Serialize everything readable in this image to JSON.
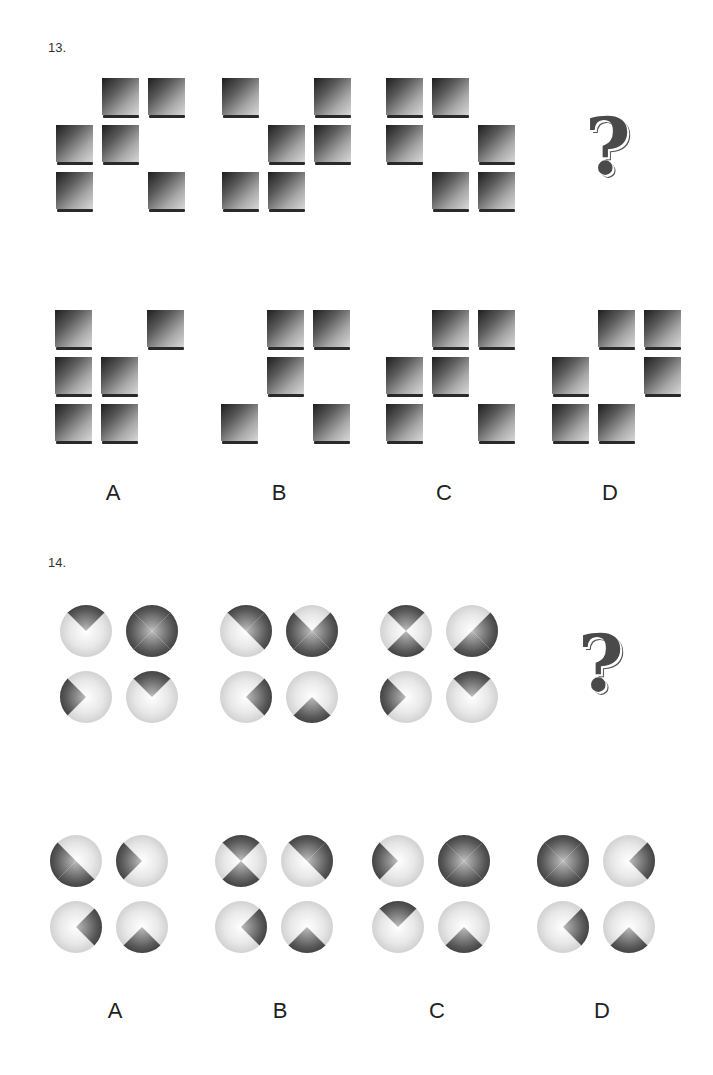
{
  "problems": [
    {
      "number": "13.",
      "type": "square-grid",
      "sequence": [
        {
          "grid": [
            [
              0,
              1,
              1
            ],
            [
              1,
              1,
              0
            ],
            [
              1,
              0,
              1
            ]
          ]
        },
        {
          "grid": [
            [
              1,
              0,
              1
            ],
            [
              0,
              1,
              1
            ],
            [
              1,
              1,
              0
            ]
          ]
        },
        {
          "grid": [
            [
              1,
              1,
              0
            ],
            [
              1,
              0,
              1
            ],
            [
              0,
              1,
              1
            ]
          ]
        }
      ],
      "question_mark": "?",
      "options": [
        {
          "label": "A",
          "grid": [
            [
              1,
              0,
              1
            ],
            [
              1,
              1,
              0
            ],
            [
              1,
              1,
              0
            ]
          ]
        },
        {
          "label": "B",
          "grid": [
            [
              0,
              1,
              1
            ],
            [
              0,
              1,
              0
            ],
            [
              1,
              0,
              1
            ]
          ]
        },
        {
          "label": "C",
          "grid": [
            [
              0,
              1,
              1
            ],
            [
              1,
              1,
              0
            ],
            [
              1,
              0,
              1
            ]
          ]
        },
        {
          "label": "D",
          "grid": [
            [
              0,
              1,
              1
            ],
            [
              1,
              0,
              1
            ],
            [
              1,
              1,
              0
            ]
          ]
        }
      ]
    },
    {
      "number": "14.",
      "type": "circle-wedges",
      "sequence": [
        {
          "circles": [
            [
              "t"
            ],
            [
              "t",
              "r",
              "b",
              "l"
            ],
            [
              "l"
            ],
            [
              "t"
            ]
          ]
        },
        {
          "circles": [
            [
              "t",
              "r"
            ],
            [
              "r",
              "b",
              "l"
            ],
            [
              "r"
            ],
            [
              "b"
            ]
          ]
        },
        {
          "circles": [
            [
              "t",
              "b"
            ],
            [
              "r",
              "b"
            ],
            [
              "l"
            ],
            [
              "t"
            ]
          ]
        }
      ],
      "question_mark": "?",
      "options": [
        {
          "label": "A",
          "circles": [
            [
              "l",
              "b"
            ],
            [
              "l"
            ],
            [
              "r"
            ],
            [
              "b"
            ]
          ]
        },
        {
          "label": "B",
          "circles": [
            [
              "t",
              "b"
            ],
            [
              "t",
              "r"
            ],
            [
              "r"
            ],
            [
              "b"
            ]
          ]
        },
        {
          "label": "C",
          "circles": [
            [
              "l"
            ],
            [
              "t",
              "r",
              "b",
              "l"
            ],
            [
              "t"
            ],
            [
              "b"
            ]
          ]
        },
        {
          "label": "D",
          "circles": [
            [
              "t",
              "r",
              "b",
              "l"
            ],
            [
              "r"
            ],
            [
              "r"
            ],
            [
              "b"
            ]
          ]
        }
      ]
    }
  ]
}
